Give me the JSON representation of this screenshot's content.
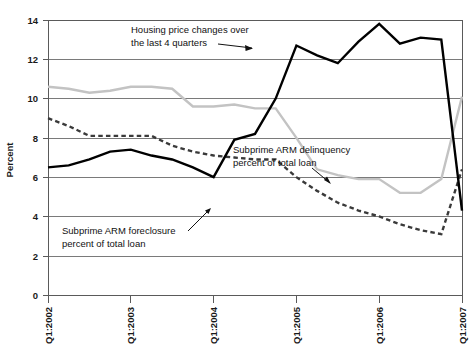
{
  "chart_data": {
    "type": "line",
    "title": "",
    "xlabel": "",
    "ylabel": "Percent",
    "ylim": [
      0,
      14
    ],
    "ytick_labels": [
      "0",
      "2",
      "4",
      "6",
      "8",
      "10",
      "12",
      "14"
    ],
    "yticks": [
      0,
      2,
      4,
      6,
      8,
      10,
      12,
      14
    ],
    "grid": true,
    "legend_position": "annotations-inline",
    "xtick_labels": [
      "Q1:2002",
      "Q1:2003",
      "Q1:2004",
      "Q1:2005",
      "Q1:2006",
      "Q1:2007"
    ],
    "xticks": [
      0,
      4,
      8,
      12,
      16,
      20
    ],
    "x": [
      "Q1:2002",
      "Q2:2002",
      "Q3:2002",
      "Q4:2002",
      "Q1:2003",
      "Q2:2003",
      "Q3:2003",
      "Q4:2003",
      "Q1:2004",
      "Q2:2004",
      "Q3:2004",
      "Q4:2004",
      "Q1:2005",
      "Q2:2005",
      "Q3:2005",
      "Q4:2005",
      "Q1:2006",
      "Q2:2006",
      "Q3:2006",
      "Q4:2006",
      "Q1:2007"
    ],
    "series": [
      {
        "name": "Housing price changes over the last 4 quarters",
        "style": "solid-black",
        "color": "#000000",
        "values": [
          6.5,
          6.6,
          6.9,
          7.3,
          7.4,
          7.1,
          6.9,
          6.5,
          6.0,
          7.9,
          8.2,
          10.0,
          12.7,
          12.2,
          11.8,
          12.9,
          13.8,
          12.8,
          13.1,
          13.0,
          12.7
        ]
      },
      {
        "name": "Subprime ARM delinquency percent of total loan",
        "style": "solid-gray",
        "color": "#c3c3c3",
        "values": [
          10.6,
          10.5,
          10.3,
          10.4,
          10.6,
          10.6,
          10.5,
          9.6,
          9.6,
          9.7,
          9.5,
          9.5,
          8.0,
          6.4,
          6.1,
          5.9,
          5.9,
          5.2,
          5.2,
          5.9,
          5.9
        ]
      },
      {
        "name": "Subprime ARM foreclosure percent of total loan",
        "style": "dashed",
        "color": "#3a3a3a",
        "values": [
          9.0,
          8.6,
          8.1,
          8.1,
          8.1,
          8.1,
          7.6,
          7.3,
          7.1,
          7.0,
          6.9,
          6.9,
          6.0,
          5.3,
          4.7,
          4.3,
          4.0,
          3.6,
          3.3,
          3.1,
          3.1
        ]
      }
    ],
    "series_tail_notes": {
      "housing_price_end_value": 4.3,
      "delinquency_end_value": 10.1,
      "foreclosure_end_value": 6.4
    },
    "annotations": [
      {
        "id": "housing-price-annotation",
        "line1": "Housing price changes over",
        "line2": "the last 4 quarters"
      },
      {
        "id": "delinquency-annotation",
        "line1": "Subprime ARM delinquency",
        "line2": "percent of total loan"
      },
      {
        "id": "foreclosure-annotation",
        "line1": "Subprime ARM foreclosure",
        "line2": "percent of total loan"
      }
    ]
  },
  "axis": {
    "y_title": "Percent",
    "y_ticks": [
      {
        "label": "14"
      },
      {
        "label": "12"
      },
      {
        "label": "10"
      },
      {
        "label": "8"
      },
      {
        "label": "6"
      },
      {
        "label": "4"
      },
      {
        "label": "2"
      },
      {
        "label": "0"
      }
    ],
    "x_ticks": [
      {
        "label": "Q1:2002"
      },
      {
        "label": "Q1:2003"
      },
      {
        "label": "Q1:2004"
      },
      {
        "label": "Q1:2005"
      },
      {
        "label": "Q1:2006"
      },
      {
        "label": "Q1:2007"
      }
    ]
  },
  "colors": {
    "housing_price": "#000000",
    "delinquency": "#c3c3c3",
    "foreclosure": "#3a3a3a",
    "gridline": "#7a7a7a",
    "frame": "#5a5a5a",
    "text": "#111111",
    "background": "#ffffff"
  }
}
